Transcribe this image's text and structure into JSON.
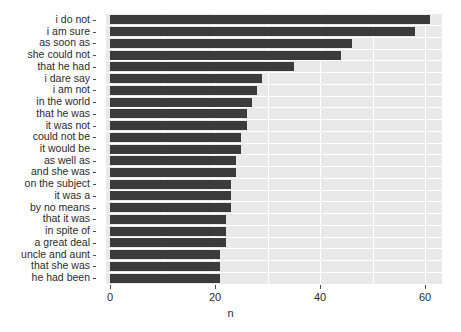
{
  "chart_data": {
    "type": "bar",
    "orientation": "horizontal",
    "title": "",
    "xlabel": "n",
    "ylabel": "",
    "xlim": [
      0,
      64
    ],
    "ylim": null,
    "grid": true,
    "legend": null,
    "bar_color": "#3b3b3b",
    "panel_color": "#e9e9e9",
    "gridline_color": "#ffffff",
    "xticks": [
      0,
      20,
      40,
      60
    ],
    "xticklabels": [
      "0",
      "20",
      "40",
      "60"
    ],
    "categories": [
      "i do not",
      "i am sure",
      "as soon as",
      "she could not",
      "that he had",
      "i dare say",
      "i am not",
      "in the world",
      "that he was",
      "it was not",
      "could not be",
      "it would be",
      "as well as",
      "and she was",
      "on the subject",
      "it was a",
      "by no means",
      "that it was",
      "in spite of",
      "a great deal",
      "uncle and aunt",
      "that she was",
      "he had been"
    ],
    "values": [
      61,
      58,
      46,
      44,
      35,
      29,
      28,
      27,
      26,
      26,
      25,
      25,
      24,
      24,
      23,
      23,
      23,
      22,
      22,
      22,
      21,
      21,
      21
    ]
  }
}
